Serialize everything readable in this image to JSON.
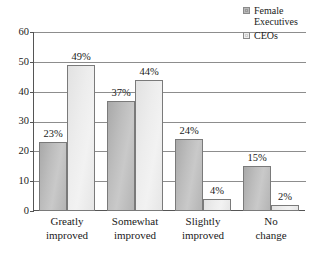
{
  "chart_data": {
    "type": "bar",
    "title": "",
    "subtitle": "",
    "xlabel": "",
    "ylabel": "",
    "ylim": [
      0,
      60
    ],
    "yticks": [
      0,
      10,
      20,
      30,
      40,
      50,
      60
    ],
    "ytick_labels": [
      "0",
      "10",
      "20",
      "30",
      "40",
      "50",
      "60"
    ],
    "grid": true,
    "legend_position": "top-right",
    "categories": [
      "Greatly improved",
      "Somewhat improved",
      "Slightly improved",
      "No change"
    ],
    "category_lines": [
      [
        "Greatly",
        "improved"
      ],
      [
        "Somewhat",
        "improved"
      ],
      [
        "Slightly",
        "improved"
      ],
      [
        "No",
        "change"
      ]
    ],
    "series": [
      {
        "name": "Female Executives",
        "name_lines": [
          "Female",
          "Executives"
        ],
        "color": "#b9b9b9",
        "values": [
          23,
          37,
          24,
          15
        ],
        "labels": [
          "23%",
          "37%",
          "24%",
          "15%"
        ]
      },
      {
        "name": "CEOs",
        "name_lines": [
          "CEOs"
        ],
        "color": "#eeeeee",
        "values": [
          49,
          44,
          4,
          2
        ],
        "labels": [
          "49%",
          "44%",
          "4%",
          "2%"
        ]
      }
    ]
  },
  "legend": {
    "items": [
      {
        "label": "Female Executives",
        "line1": "Female",
        "line2": "Executives",
        "swatch": "series-female"
      },
      {
        "label": "CEOs",
        "line1": "CEOs",
        "line2": "",
        "swatch": "series-ceos"
      }
    ]
  },
  "axis": {
    "y_tick_0": "0",
    "y_tick_1": "10",
    "y_tick_2": "20",
    "y_tick_3": "30",
    "y_tick_4": "40",
    "y_tick_5": "50",
    "y_tick_6": "60"
  }
}
